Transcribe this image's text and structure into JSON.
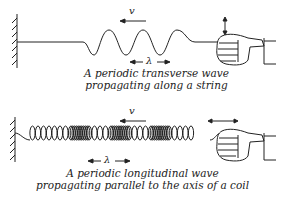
{
  "diagrams": [
    {
      "id": "transverse",
      "caption_line1": "A periodic transverse wave",
      "caption_line2": "propagating along a string",
      "velocity_label": "v",
      "wavelength_label": "λ",
      "medium": "string",
      "hand_motion": "vertical",
      "wave_direction": "left"
    },
    {
      "id": "longitudinal",
      "caption_line1": "A periodic longitudinal wave",
      "caption_line2": "propagating parallel to the axis of a coil",
      "velocity_label": "v",
      "wavelength_label": "λ",
      "medium": "coil",
      "hand_motion": "horizontal",
      "wave_direction": "left"
    }
  ],
  "colors": {
    "ink": "#222222",
    "background": "#ffffff"
  }
}
